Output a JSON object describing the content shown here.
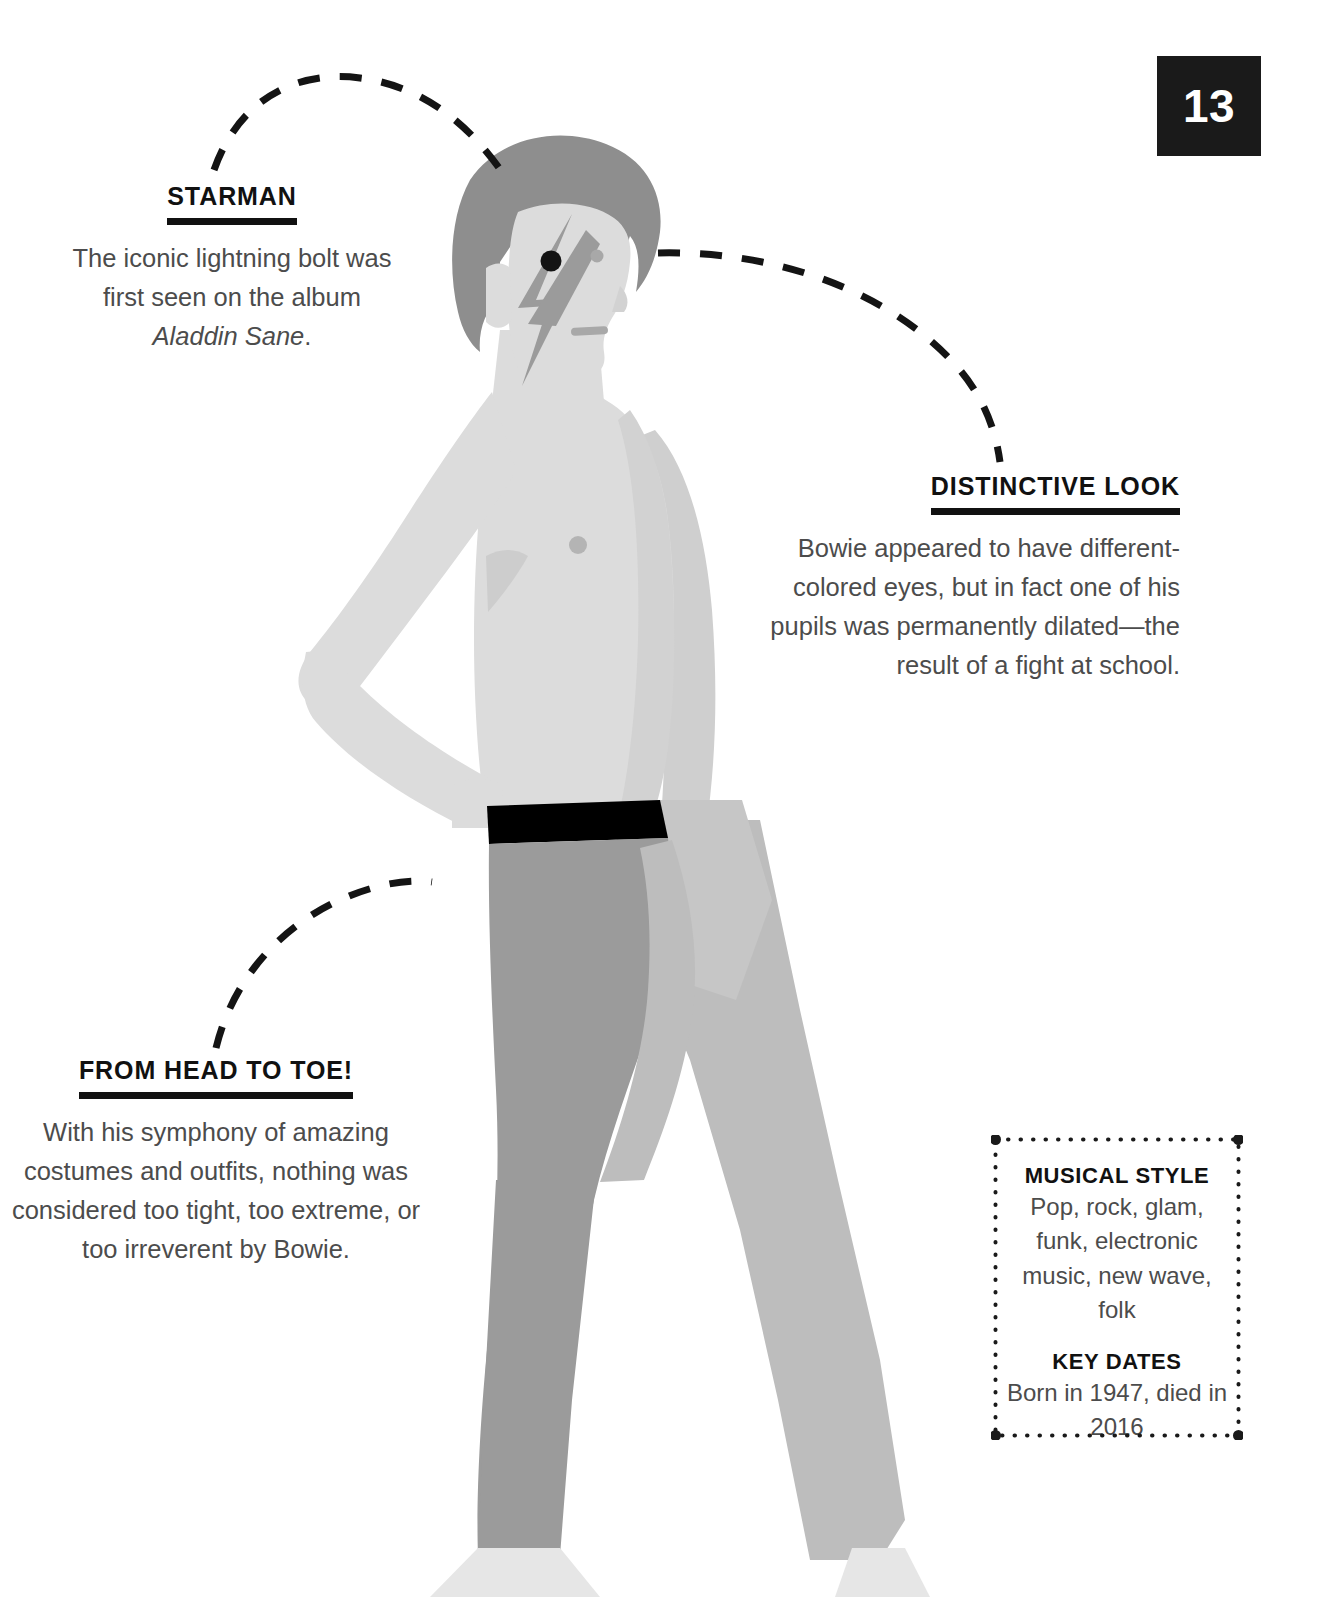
{
  "page": {
    "number": "13"
  },
  "callouts": [
    {
      "id": "starman",
      "heading": "STARMAN",
      "body_pre": "The iconic lightning bolt was first seen on the album ",
      "body_em": "Aladdin Sane",
      "body_post": "."
    },
    {
      "id": "distinctive-look",
      "heading": "DISTINCTIVE LOOK",
      "body": "Bowie appeared to have different-colored eyes, but in fact one of his pupils was permanently dilated—the result of a fight at school."
    },
    {
      "id": "from-head-to-toe",
      "heading": "FROM HEAD TO TOE!",
      "body": "With his symphony of amazing costumes and outfits, nothing was considered too tight, too extreme, or too irreverent by Bowie."
    }
  ],
  "side_box": {
    "groups": [
      {
        "title": "MUSICAL STYLE",
        "text": "Pop, rock, glam, funk, electronic music, new wave, folk"
      },
      {
        "title": "KEY DATES",
        "text": "Born in 1947, died in 2016"
      }
    ]
  },
  "illustration": {
    "subject": "stylized-side-profile-of-david-bowie",
    "icons": [
      "lightning-bolt-face-marking",
      "dilated-pupil-dot",
      "normal-eye-dot",
      "mouth-line",
      "nipple-dot",
      "black-waistband"
    ],
    "colors": {
      "hair": "#8e8e8e",
      "face": "#dcdcdc",
      "bolt": "#9b9b9b",
      "skin": "#dcdcdc",
      "skin_shade": "#d2d2d2",
      "leg_front": "#9b9b9b",
      "leg_back": "#bdbdbd",
      "waistband": "#000000",
      "foot": "#e6e6e6",
      "ink": "#111111",
      "body_text": "#4c4c4c"
    }
  },
  "connectors": [
    {
      "id": "connector-starman",
      "style": "dashed-arc"
    },
    {
      "id": "connector-distinctive-look",
      "style": "dashed-arc"
    },
    {
      "id": "connector-from-head-to-toe",
      "style": "dashed-arc"
    }
  ]
}
